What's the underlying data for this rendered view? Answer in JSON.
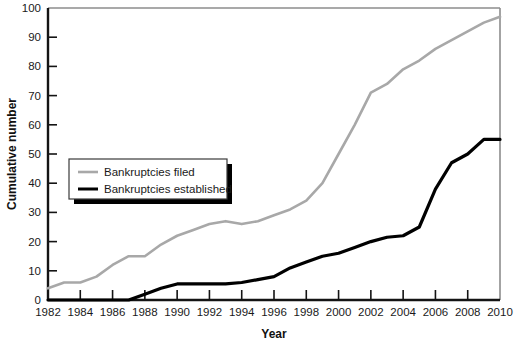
{
  "chart_data": {
    "type": "line",
    "title": "",
    "xlabel": "Year",
    "ylabel": "Cumulative number",
    "xlim": [
      1982,
      2010
    ],
    "ylim": [
      0,
      100
    ],
    "grid": false,
    "legend_position": "upper-left-inside",
    "xticks": [
      1982,
      1984,
      1986,
      1988,
      1990,
      1992,
      1994,
      1996,
      1998,
      2000,
      2002,
      2004,
      2006,
      2008,
      2010
    ],
    "xtick_labels": [
      "1982",
      "1984",
      "1986",
      "1988",
      "1990",
      "1992",
      "1994",
      "1996",
      "1998",
      "2000",
      "2002",
      "2004",
      "2006",
      "2008",
      "2010"
    ],
    "yticks": [
      0,
      10,
      20,
      30,
      40,
      50,
      60,
      70,
      80,
      90,
      100
    ],
    "ytick_labels": [
      "0",
      "10",
      "20",
      "30",
      "40",
      "50",
      "60",
      "70",
      "80",
      "90",
      "100"
    ],
    "x": [
      1982,
      1983,
      1984,
      1985,
      1986,
      1987,
      1988,
      1989,
      1990,
      1991,
      1992,
      1993,
      1994,
      1995,
      1996,
      1997,
      1998,
      1999,
      2000,
      2001,
      2002,
      2003,
      2004,
      2005,
      2006,
      2007,
      2008,
      2009,
      2010
    ],
    "series": [
      {
        "name": "Bankruptcies filed",
        "color": "#a8a8a8",
        "values": [
          4,
          6,
          6,
          8,
          12,
          15,
          15,
          19,
          22,
          24,
          26,
          27,
          26,
          27,
          29,
          31,
          34,
          40,
          50,
          60,
          71,
          74,
          79,
          82,
          86,
          89,
          92,
          95,
          97
        ]
      },
      {
        "name": "Bankruptcies established",
        "color": "#000000",
        "values": [
          0,
          0,
          0,
          0,
          0,
          0,
          2,
          4,
          5.5,
          5.5,
          5.5,
          5.5,
          6,
          7,
          8,
          11,
          13,
          15,
          16,
          18,
          20,
          21.5,
          22,
          25,
          38,
          47,
          50,
          55,
          55
        ]
      }
    ]
  },
  "legend": {
    "items": [
      {
        "label": "Bankruptcies filed",
        "color": "#a8a8a8"
      },
      {
        "label": "Bankruptcies established",
        "color": "#000000"
      }
    ]
  },
  "axes": {
    "y_title": "Cumulative number",
    "x_title": "Year"
  }
}
